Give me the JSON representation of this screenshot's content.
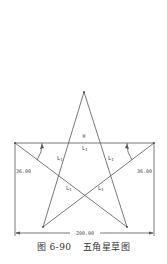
{
  "diagram": {
    "title": "五角星草图",
    "figure_number": "图 6-90",
    "colors": {
      "line": "#555555",
      "text": "#444444",
      "background": "#ffffff"
    },
    "dimensions": {
      "width_label": "200.00",
      "left_angle_label": "36.00",
      "right_angle_label": "36.00"
    },
    "constraint_labels": {
      "horizontal": "H",
      "equal": "L",
      "equal_sub": "1"
    },
    "points": {
      "apex": [
        84,
        92
      ],
      "bottom_left": [
        43,
        227
      ],
      "bottom_right": [
        127,
        227
      ],
      "top_left": [
        15,
        143
      ],
      "top_right": [
        154,
        143
      ]
    }
  }
}
